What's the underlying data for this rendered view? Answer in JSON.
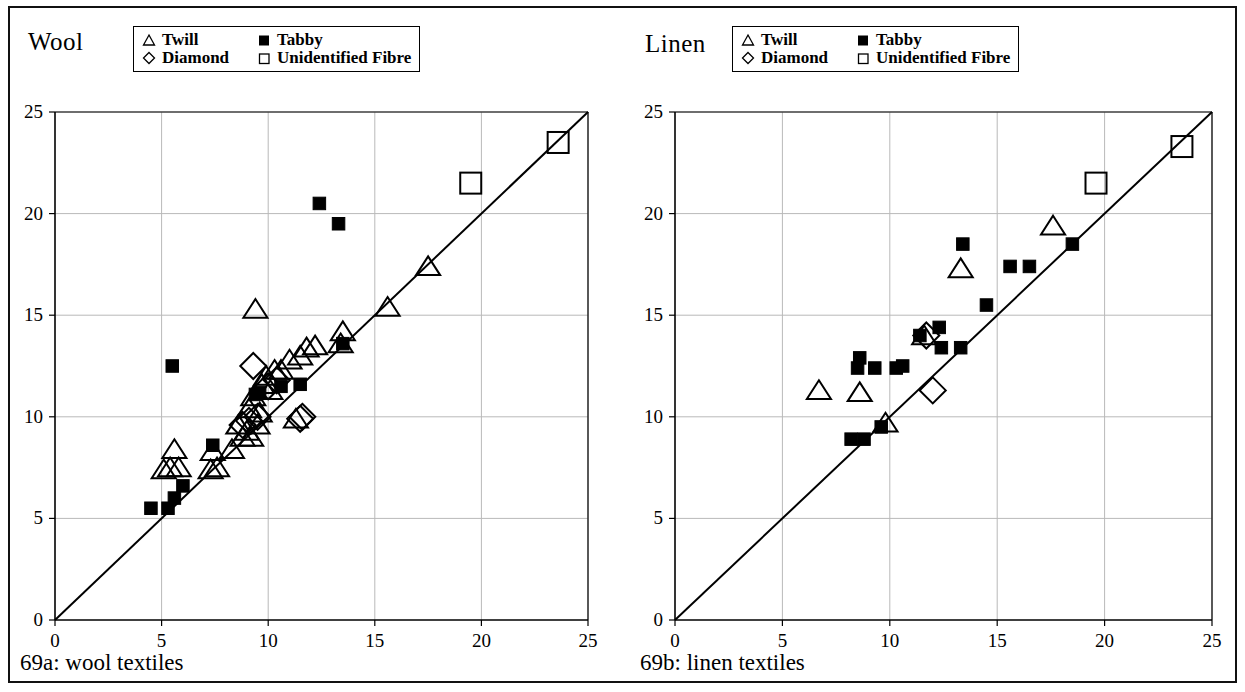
{
  "figure": {
    "border_color": "#111111",
    "background": "#ffffff",
    "marker_color": "#000000",
    "grid_color": "#b9b9b9",
    "axis_color": "#000000"
  },
  "legend": {
    "items": [
      {
        "label": "Twill",
        "symbol": "triangle-open"
      },
      {
        "label": "Tabby",
        "symbol": "square-filled"
      },
      {
        "label": "Diamond",
        "symbol": "diamond-open"
      },
      {
        "label": "Unidentified Fibre",
        "symbol": "square-open"
      }
    ]
  },
  "panels": [
    {
      "id": "wool",
      "title": "Wool",
      "caption": "69a: wool textiles"
    },
    {
      "id": "linen",
      "title": "Linen",
      "caption": "69b: linen textiles"
    }
  ],
  "chart_data": [
    {
      "type": "scatter",
      "id": "wool",
      "title": "Wool",
      "caption": "69a: wool textiles",
      "xlabel": "",
      "ylabel": "",
      "xlim": [
        0,
        25
      ],
      "ylim": [
        0,
        25
      ],
      "xticks": [
        0,
        5,
        10,
        15,
        20,
        25
      ],
      "yticks": [
        0,
        5,
        10,
        15,
        20,
        25
      ],
      "grid": true,
      "legend_position": "top",
      "reference_line": {
        "type": "identity",
        "from": [
          0,
          0
        ],
        "to": [
          25,
          25
        ]
      },
      "series": [
        {
          "name": "Twill",
          "marker": "triangle-open",
          "points": [
            [
              5.1,
              7.4
            ],
            [
              5.4,
              7.5
            ],
            [
              5.6,
              8.4
            ],
            [
              5.8,
              7.5
            ],
            [
              7.3,
              7.4
            ],
            [
              7.4,
              8.3
            ],
            [
              7.6,
              7.5
            ],
            [
              8.3,
              8.4
            ],
            [
              8.6,
              9.6
            ],
            [
              8.8,
              9.0
            ],
            [
              9.0,
              9.3
            ],
            [
              9.1,
              10.4
            ],
            [
              9.2,
              9.0
            ],
            [
              9.3,
              11.0
            ],
            [
              9.4,
              15.3
            ],
            [
              9.5,
              9.6
            ],
            [
              9.6,
              10.2
            ],
            [
              9.7,
              11.6
            ],
            [
              9.9,
              12.0
            ],
            [
              10.1,
              11.3
            ],
            [
              10.3,
              12.3
            ],
            [
              10.6,
              12.3
            ],
            [
              11.0,
              12.8
            ],
            [
              11.3,
              9.9
            ],
            [
              11.5,
              13.0
            ],
            [
              11.8,
              13.4
            ],
            [
              12.2,
              13.5
            ],
            [
              13.4,
              13.6
            ],
            [
              13.5,
              14.2
            ],
            [
              15.6,
              15.4
            ],
            [
              17.5,
              17.4
            ]
          ]
        },
        {
          "name": "Tabby",
          "marker": "square-filled",
          "points": [
            [
              4.5,
              5.5
            ],
            [
              5.3,
              5.5
            ],
            [
              5.6,
              6.0
            ],
            [
              6.0,
              6.6
            ],
            [
              5.5,
              12.5
            ],
            [
              7.4,
              8.6
            ],
            [
              9.4,
              11.1
            ],
            [
              9.6,
              11.2
            ],
            [
              10.6,
              11.5
            ],
            [
              11.5,
              11.6
            ],
            [
              12.4,
              20.5
            ],
            [
              13.3,
              19.5
            ],
            [
              13.5,
              13.6
            ]
          ]
        },
        {
          "name": "Diamond",
          "marker": "diamond-open",
          "points": [
            [
              8.8,
              9.6
            ],
            [
              9.1,
              9.8
            ],
            [
              9.3,
              12.5
            ],
            [
              9.5,
              10.0
            ],
            [
              10.0,
              11.5
            ],
            [
              10.4,
              11.8
            ],
            [
              11.5,
              9.9
            ],
            [
              11.6,
              10.0
            ]
          ]
        },
        {
          "name": "Unidentified Fibre",
          "marker": "square-open",
          "points": [
            [
              19.5,
              21.5
            ],
            [
              23.6,
              23.5
            ]
          ]
        }
      ]
    },
    {
      "type": "scatter",
      "id": "linen",
      "title": "Linen",
      "caption": "69b: linen textiles",
      "xlabel": "",
      "ylabel": "",
      "xlim": [
        0,
        25
      ],
      "ylim": [
        0,
        25
      ],
      "xticks": [
        0,
        5,
        10,
        15,
        20,
        25
      ],
      "yticks": [
        0,
        5,
        10,
        15,
        20,
        25
      ],
      "grid": true,
      "legend_position": "top",
      "reference_line": {
        "type": "identity",
        "from": [
          0,
          0
        ],
        "to": [
          25,
          25
        ]
      },
      "series": [
        {
          "name": "Twill",
          "marker": "triangle-open",
          "points": [
            [
              6.7,
              11.3
            ],
            [
              8.6,
              11.2
            ],
            [
              9.8,
              9.7
            ],
            [
              11.6,
              14.0
            ],
            [
              13.3,
              17.3
            ],
            [
              17.6,
              19.4
            ]
          ]
        },
        {
          "name": "Tabby",
          "marker": "square-filled",
          "points": [
            [
              8.2,
              8.9
            ],
            [
              8.8,
              8.9
            ],
            [
              8.5,
              12.4
            ],
            [
              8.6,
              12.9
            ],
            [
              9.3,
              12.4
            ],
            [
              9.6,
              9.5
            ],
            [
              10.3,
              12.4
            ],
            [
              10.6,
              12.5
            ],
            [
              11.4,
              14.0
            ],
            [
              12.3,
              14.4
            ],
            [
              12.4,
              13.4
            ],
            [
              13.3,
              13.4
            ],
            [
              13.4,
              18.5
            ],
            [
              14.5,
              15.5
            ],
            [
              15.6,
              17.4
            ],
            [
              16.5,
              17.4
            ],
            [
              18.5,
              18.5
            ]
          ]
        },
        {
          "name": "Diamond",
          "marker": "diamond-open",
          "points": [
            [
              11.7,
              14.0
            ],
            [
              12.0,
              11.3
            ]
          ]
        },
        {
          "name": "Unidentified Fibre",
          "marker": "square-open",
          "points": [
            [
              19.6,
              21.5
            ],
            [
              23.6,
              23.3
            ]
          ]
        }
      ]
    }
  ]
}
